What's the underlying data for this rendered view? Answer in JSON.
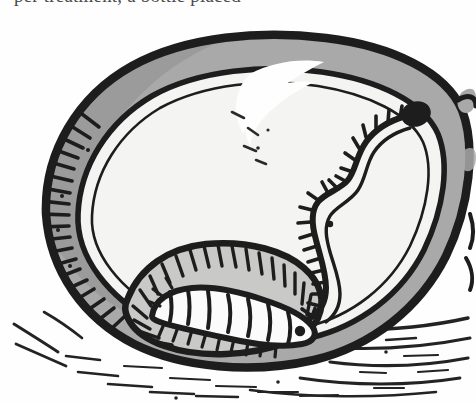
{
  "page": {
    "width": 476,
    "height": 403,
    "background_color": "#fefefe",
    "media": "scanned book page, black-and-white pen-and-ink halftone"
  },
  "caption": {
    "clipped_text_line": "per treatment, a bottle placed",
    "note": "only the bottom edge of this line of body text is visible; it is cut off by the top of the crop"
  },
  "figure": {
    "colors": {
      "ink": "#1d1d1d",
      "rind_gray": "#a9a9a9",
      "rind_gray_shadow": "#8f8f8f",
      "flesh_light": "#f4f4f2",
      "cavity_gray": "#c9c9c7",
      "larva_white": "#fbfbfb",
      "paper": "#fefefe"
    },
    "parts": [
      {
        "name": "outer-rind-outline",
        "label": "Outer skin / rind outline",
        "description": "heavy ragged black contour around the whole fruit"
      },
      {
        "name": "rind-band",
        "label": "Rind band",
        "description": "gray ring between the outer contour and the inner flesh line"
      },
      {
        "name": "rind-hatch-ticks",
        "label": "Rind hatching",
        "description": "short comb-like ticks along the inside of the rind on the left"
      },
      {
        "name": "flesh-area",
        "label": "Flesh",
        "description": "large pale interior area"
      },
      {
        "name": "skin-highlight",
        "label": "Highlight break",
        "description": "white broken gap in the rind near the top, reading as a specular highlight"
      },
      {
        "name": "larva-tunnel",
        "label": "Feeding tunnel",
        "description": "long S-curving burrow with hatch marks along one side"
      },
      {
        "name": "entry-hole",
        "label": "Entry hole",
        "description": "solid black blob at the top end of the tunnel"
      },
      {
        "name": "feeding-cavity",
        "label": "Feeding cavity",
        "description": "gray hollowed chamber at the lower left, edged with dense hatching"
      },
      {
        "name": "larva",
        "label": "Larva / grub",
        "description": "segmented pale caterpillar lying inside the cavity"
      },
      {
        "name": "ground-shadow-hatching",
        "label": "Ground shadow",
        "description": "loose horizontal strokes under the fruit suggesting soil and cast shadow"
      },
      {
        "name": "stem-nub",
        "label": "Stem nub",
        "description": "small gray bump at the far right edge"
      }
    ],
    "larva_segment_count": 8
  }
}
